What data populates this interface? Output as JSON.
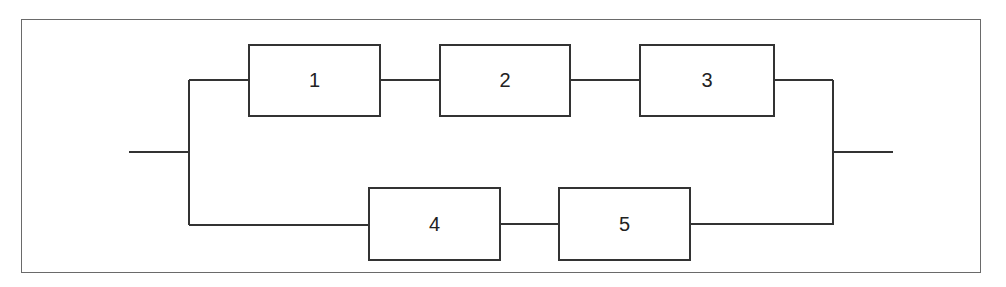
{
  "diagram": {
    "type": "reliability-block-diagram",
    "colors": {
      "line": "#333333",
      "frame": "#6a6a6a",
      "background": "#ffffff"
    },
    "blocks": [
      {
        "id": "1",
        "label": "1",
        "branch": "top"
      },
      {
        "id": "2",
        "label": "2",
        "branch": "top"
      },
      {
        "id": "3",
        "label": "3",
        "branch": "top"
      },
      {
        "id": "4",
        "label": "4",
        "branch": "bottom"
      },
      {
        "id": "5",
        "label": "5",
        "branch": "bottom"
      }
    ],
    "branches": [
      {
        "name": "top",
        "series": [
          "1",
          "2",
          "3"
        ]
      },
      {
        "name": "bottom",
        "series": [
          "4",
          "5"
        ]
      }
    ],
    "connections": [
      [
        "input",
        "split"
      ],
      [
        "split",
        "1"
      ],
      [
        "1",
        "2"
      ],
      [
        "2",
        "3"
      ],
      [
        "3",
        "join"
      ],
      [
        "split",
        "4"
      ],
      [
        "4",
        "5"
      ],
      [
        "5",
        "join"
      ],
      [
        "join",
        "output"
      ]
    ]
  }
}
